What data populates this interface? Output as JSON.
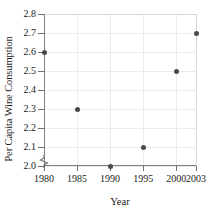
{
  "chart_data": {
    "type": "scatter",
    "title": "",
    "xlabel": "Year",
    "ylabel": "Per Capita Wine Consumption",
    "x": [
      1980,
      1985,
      1990,
      1995,
      2000,
      2003
    ],
    "values": [
      2.6,
      2.3,
      2.0,
      2.1,
      2.5,
      2.7
    ],
    "series": [
      {
        "name": "Per Capita Wine Consumption",
        "values": [
          2.6,
          2.3,
          2.0,
          2.1,
          2.5,
          2.7
        ]
      }
    ],
    "points": [
      {
        "x": 1980,
        "y": 2.6
      },
      {
        "x": 1985,
        "y": 2.3
      },
      {
        "x": 1990,
        "y": 2.0
      },
      {
        "x": 1995,
        "y": 2.1
      },
      {
        "x": 2000,
        "y": 2.5
      },
      {
        "x": 2003,
        "y": 2.7
      }
    ],
    "xlim": [
      1980,
      2003
    ],
    "ylim": [
      2.0,
      2.8
    ],
    "x_ticks": [
      1980,
      1985,
      1990,
      1995,
      2000,
      2003
    ],
    "x_tick_labels": [
      "1980",
      "1985",
      "1990",
      "1995",
      "2000",
      "2003"
    ],
    "y_ticks": [
      2.0,
      2.1,
      2.2,
      2.3,
      2.4,
      2.5,
      2.6,
      2.7,
      2.8
    ],
    "y_tick_labels": [
      "2.0",
      "2.1",
      "2.2",
      "2.3",
      "2.4",
      "2.5",
      "2.6",
      "2.7",
      "2.8"
    ],
    "grid": true,
    "legend": "none",
    "y_axis_break": true,
    "marker_color": "#4a4a4a",
    "grid_color": "#ebebeb",
    "axis_color": "#808080"
  },
  "axes": {
    "y_title": "Per Capita Wine Consumption",
    "x_title": "Year"
  }
}
